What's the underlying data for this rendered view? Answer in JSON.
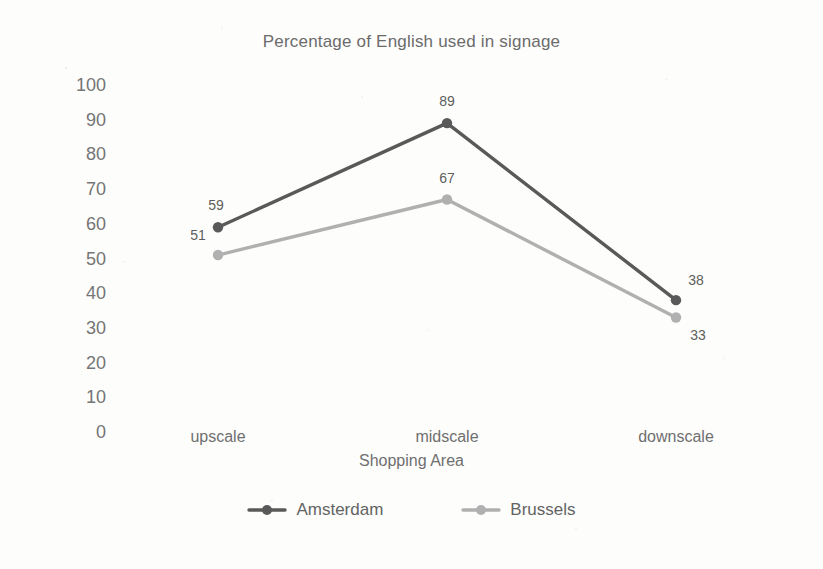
{
  "chart_data": {
    "type": "line",
    "title": "Percentage of English used in signage",
    "xlabel": "Shopping Area",
    "ylabel": "Percentage",
    "categories": [
      "upscale",
      "midscale",
      "downscale"
    ],
    "series": [
      {
        "name": "Amsterdam",
        "values": [
          59,
          89,
          38
        ],
        "color": "#595959"
      },
      {
        "name": "Brussels",
        "values": [
          51,
          67,
          33
        ],
        "color": "#b0b0b0"
      }
    ],
    "ylim": [
      0,
      100
    ],
    "ytick_step": 10,
    "yticks": [
      100,
      90,
      80,
      70,
      60,
      50,
      40,
      30,
      20,
      10,
      0
    ],
    "grid": false,
    "legend_position": "bottom",
    "data_labels": true,
    "markers": "circle"
  }
}
